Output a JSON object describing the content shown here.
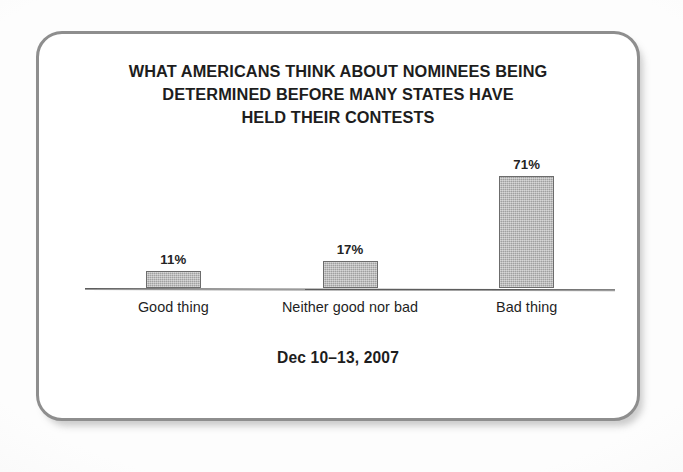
{
  "card": {
    "border_color": "#8e8e8e",
    "background": "#ffffff"
  },
  "chart_data": {
    "type": "bar",
    "title": "WHAT AMERICANS THINK ABOUT NOMINEES BEING DETERMINED BEFORE MANY STATES HAVE HELD THEIR CONTESTS",
    "title_lines": [
      "WHAT AMERICANS THINK ABOUT NOMINEES BEING",
      "DETERMINED BEFORE MANY STATES HAVE",
      "HELD THEIR CONTESTS"
    ],
    "subtitle": "",
    "xlabel": "",
    "ylabel": "",
    "ylim": [
      0,
      80
    ],
    "grid": false,
    "legend": false,
    "categories": [
      "Good thing",
      "Neither good nor bad",
      "Bad thing"
    ],
    "values": [
      11,
      17,
      71
    ],
    "value_labels": [
      "11%",
      "17%",
      "71%"
    ],
    "bar_color": "#b2b2b2",
    "bar_outline_color": "#6c6c6c",
    "axis_color": "#5d5d5d",
    "footnote": "Dec 10–13, 2007"
  }
}
